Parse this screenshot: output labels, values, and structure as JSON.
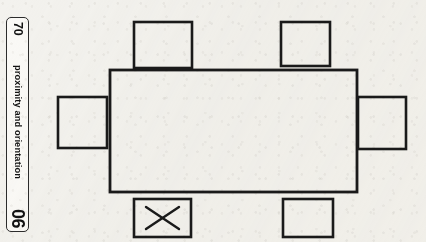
{
  "page": {
    "background_color": "#f3f2ee",
    "ink_color": "#1a1a1a"
  },
  "tab": {
    "page_number": "70",
    "section_label": "proximity and orientation",
    "chapter_number": "06"
  },
  "diagram": {
    "name": "seating-plan-around-rectangular-table",
    "table": {
      "label": "table",
      "x": 110,
      "y": 70,
      "width": 247,
      "height": 122
    },
    "seats": [
      {
        "id": "seat-top-left",
        "position": "top-left",
        "x": 134,
        "y": 22,
        "width": 58,
        "height": 46,
        "marked": false,
        "mark": ""
      },
      {
        "id": "seat-top-right",
        "position": "top-right",
        "x": 281,
        "y": 22,
        "width": 49,
        "height": 44,
        "marked": false,
        "mark": ""
      },
      {
        "id": "seat-left",
        "position": "left",
        "x": 58,
        "y": 97,
        "width": 49,
        "height": 51,
        "marked": false,
        "mark": ""
      },
      {
        "id": "seat-right",
        "position": "right",
        "x": 358,
        "y": 97,
        "width": 48,
        "height": 52,
        "marked": false,
        "mark": ""
      },
      {
        "id": "seat-bottom-left",
        "position": "bottom-left",
        "x": 134,
        "y": 199,
        "width": 57,
        "height": 38,
        "marked": true,
        "mark": "X"
      },
      {
        "id": "seat-bottom-right",
        "position": "bottom-right",
        "x": 283,
        "y": 199,
        "width": 50,
        "height": 38,
        "marked": false,
        "mark": ""
      }
    ]
  }
}
